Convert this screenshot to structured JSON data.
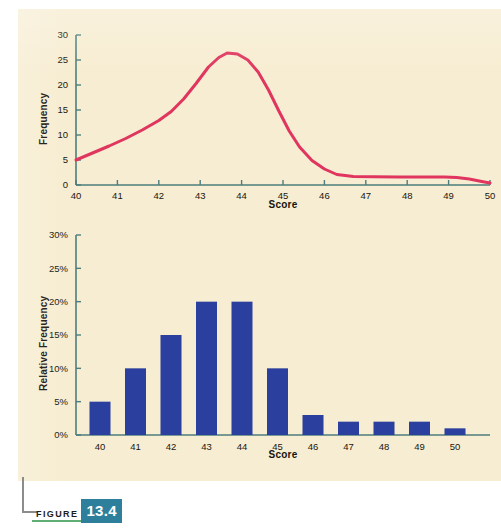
{
  "figure": {
    "label_word": "FIGURE",
    "number": "13.4",
    "bracket_color": "#8c8c8c",
    "underline_color": "#5faf74",
    "number_bg": "#2e7f9b"
  },
  "panel": {
    "background_color": "#f7edd2"
  },
  "chart_data": [
    {
      "id": "frequency-curve",
      "type": "line",
      "title": "",
      "xlabel": "Score",
      "ylabel": "Frequency",
      "xlim": [
        40,
        50
      ],
      "ylim": [
        0,
        30
      ],
      "xticks": [
        40,
        41,
        42,
        43,
        44,
        45,
        46,
        47,
        48,
        49,
        50
      ],
      "xticklabels": [
        "40",
        "41",
        "42",
        "43",
        "44",
        "45",
        "46",
        "47",
        "48",
        "49",
        "50"
      ],
      "yticks": [
        0,
        5,
        10,
        15,
        20,
        25,
        30
      ],
      "yticklabels": [
        "0",
        "5",
        "10",
        "15",
        "20",
        "25",
        "30"
      ],
      "grid": false,
      "legend": "none",
      "series": [
        {
          "name": "Frequency",
          "color": "#e0355e",
          "line_width": 3,
          "x": [
            40.0,
            40.4,
            40.8,
            41.2,
            41.6,
            42.0,
            42.3,
            42.6,
            42.9,
            43.2,
            43.45,
            43.65,
            43.9,
            44.15,
            44.4,
            44.65,
            44.9,
            45.15,
            45.4,
            45.7,
            46.0,
            46.3,
            46.7,
            47.2,
            47.8,
            48.4,
            48.9,
            49.2,
            49.5,
            49.8,
            50.0
          ],
          "y": [
            5.0,
            6.4,
            7.8,
            9.3,
            11.0,
            12.9,
            14.7,
            17.2,
            20.3,
            23.6,
            25.5,
            26.4,
            26.2,
            25.0,
            22.6,
            19.0,
            14.8,
            10.8,
            7.6,
            4.9,
            3.2,
            2.1,
            1.7,
            1.65,
            1.6,
            1.6,
            1.6,
            1.5,
            1.2,
            0.7,
            0.4
          ]
        }
      ]
    },
    {
      "id": "relative-frequency-histogram",
      "type": "bar",
      "title": "",
      "xlabel": "Score",
      "ylabel": "Relative Frequency",
      "categories": [
        "40",
        "41",
        "42",
        "43",
        "44",
        "45",
        "46",
        "47",
        "48",
        "49",
        "50"
      ],
      "values": [
        5,
        10,
        15,
        20,
        20,
        10,
        3,
        2,
        2,
        2,
        1
      ],
      "ylim": [
        0,
        30
      ],
      "yticks": [
        0,
        5,
        10,
        15,
        20,
        25,
        30
      ],
      "yticklabels": [
        "0%",
        "5%",
        "10%",
        "15%",
        "20%",
        "25%",
        "30%"
      ],
      "grid": false,
      "legend": "none",
      "bar_color": "#2b3f9e"
    }
  ],
  "axis_color": "#4d7d7d"
}
